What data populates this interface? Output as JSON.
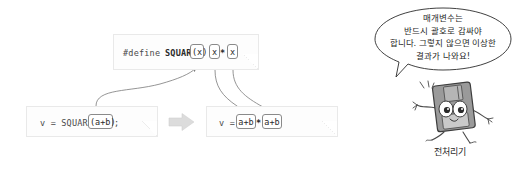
{
  "macro_definition": {
    "directive": "#define",
    "macro_name": "SQUARE",
    "param_token": "(x)",
    "body_token_left": "x",
    "body_operator": "*",
    "body_token_right": "x"
  },
  "source_code": {
    "prefix": "v = SQUARE",
    "argument_token": "(a+b)",
    "suffix": ";"
  },
  "expanded_code": {
    "prefix": "v =",
    "left_token": "a+b",
    "operator": "*",
    "right_token": "a+b"
  },
  "transform_arrow": {
    "icon": "block-arrow-right-icon",
    "color": "#dcdcdc"
  },
  "speech_bubble": {
    "line1": "매개변수는",
    "line2": "반드시 괄호로 감싸야",
    "line3": "합니다. 그렇지 않으면 이상한",
    "line4": "결과가 나와요!"
  },
  "mascot": {
    "icon": "floppy-disk-character-icon",
    "caption": "전처리기"
  },
  "colors": {
    "note_background": "#fdfdfd",
    "note_border": "#e9e9e9",
    "code_text": "#4a4a4a",
    "token_border": "#8a8a8a",
    "arrow_line": "#7a7a7a",
    "mascot_body": "#8d8d8d"
  }
}
